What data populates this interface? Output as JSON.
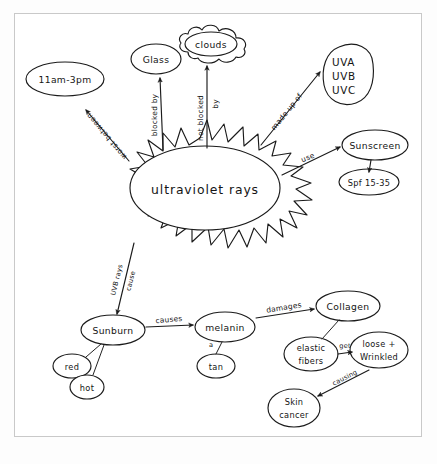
{
  "document": {
    "title": "ultraviolet rays concept map",
    "medium": "hand-drawn ink on paper",
    "ink_color": "#1b1b1b",
    "paper_color": "#ffffff",
    "frame_color": "#c9c9c9"
  },
  "center": {
    "label": "ultraviolet rays",
    "shape": "sun-burst-ellipse"
  },
  "nodes": {
    "time": {
      "label": "11am-3pm",
      "shape": "ellipse"
    },
    "glass": {
      "label": "Glass",
      "shape": "ellipse"
    },
    "clouds": {
      "label": "clouds",
      "shape": "cloud"
    },
    "uv_types": {
      "line1": "UVA",
      "line2": "UVB",
      "line3": "UVC",
      "shape": "rounded-blob"
    },
    "sunscreen": {
      "label": "Sunscreen",
      "shape": "ellipse"
    },
    "spf": {
      "label": "Spf 15-35",
      "shape": "ellipse"
    },
    "sunburn": {
      "label": "Sunburn",
      "shape": "ellipse"
    },
    "red": {
      "label": "red",
      "shape": "ellipse"
    },
    "hot": {
      "label": "hot",
      "shape": "ellipse"
    },
    "melanin": {
      "label": "melanin",
      "shape": "ellipse"
    },
    "tan": {
      "label": "tan",
      "shape": "ellipse"
    },
    "collagen": {
      "label": "Collagen",
      "shape": "ellipse"
    },
    "elastic_fibers": {
      "line1": "elastic",
      "line2": "fibers",
      "shape": "ellipse"
    },
    "loose_wrinkled": {
      "line1": "loose +",
      "line2": "Wrinkled",
      "shape": "ellipse"
    },
    "skin_cancer": {
      "line1": "Skin",
      "line2": "cancer",
      "shape": "ellipse"
    }
  },
  "edges": {
    "worst_between": "worst between",
    "blocked_by": "blocked by",
    "not_blocked_by_a": "not blocked",
    "not_blocked_by_b": "by",
    "made_up_of": "made up of",
    "use": "use",
    "uvb_rays": "UVB rays",
    "cause": "cause",
    "causes": "causes",
    "damages": "damages",
    "get": "get",
    "causing": "causing",
    "a": "a"
  }
}
